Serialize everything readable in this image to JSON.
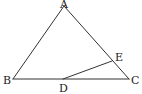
{
  "figure": {
    "type": "geometry-diagram",
    "points": {
      "A": {
        "label": "A",
        "x": 64,
        "y": 6
      },
      "B": {
        "label": "B",
        "x": 13,
        "y": 79
      },
      "C": {
        "label": "C",
        "x": 129,
        "y": 79
      },
      "D": {
        "label": "D",
        "x": 63,
        "y": 79
      },
      "E": {
        "label": "E",
        "x": 112,
        "y": 61
      }
    },
    "segments": [
      {
        "from": "A",
        "to": "B"
      },
      {
        "from": "A",
        "to": "C"
      },
      {
        "from": "B",
        "to": "C"
      },
      {
        "from": "D",
        "to": "E"
      }
    ],
    "colors": {
      "line": "#333333",
      "label": "#222222",
      "background": "#ffffff"
    }
  }
}
